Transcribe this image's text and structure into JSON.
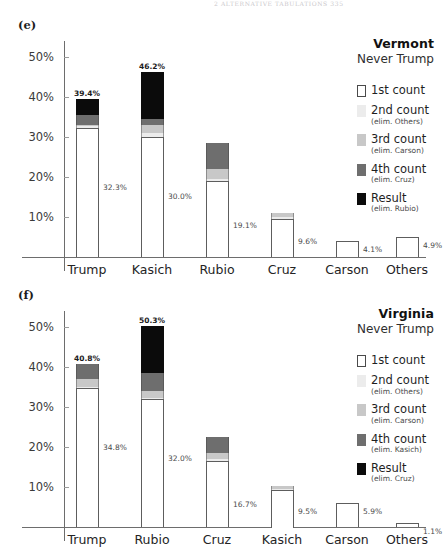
{
  "page_header": "2 ALTERNATIVE TABULATIONS   335",
  "panels": [
    {
      "id": "panel-e",
      "label": "(e)",
      "state": "Vermont",
      "scenario": "Never Trump",
      "axis": {
        "ticks": [
          "50%",
          "40%",
          "30%",
          "20%",
          "10%"
        ],
        "tick_values": [
          50,
          40,
          30,
          20,
          10
        ]
      },
      "legend": [
        {
          "name": "1st count",
          "note": ""
        },
        {
          "name": "2nd count",
          "note": "(elim. Others)"
        },
        {
          "name": "3rd count",
          "note": "(elim. Carson)"
        },
        {
          "name": "4th count",
          "note": "(elim. Cruz)"
        },
        {
          "name": "Result",
          "note": "(elim. Rubio)"
        }
      ],
      "chart_data": {
        "type": "bar",
        "stacked": true,
        "title": "Vermont",
        "subtitle": "Never Trump",
        "xlabel": "",
        "ylabel": "",
        "ylim": [
          0,
          54
        ],
        "grid": false,
        "legend_position": "right",
        "categories": [
          "Trump",
          "Kasich",
          "Rubio",
          "Cruz",
          "Carson",
          "Others"
        ],
        "series": [
          {
            "name": "1st count",
            "values": [
              32.3,
              30.0,
              19.1,
              9.6,
              4.1,
              4.9
            ]
          },
          {
            "name": "2nd count (elim. Others)",
            "values": [
              0.4,
              1.1,
              0.5,
              0.3,
              0.0,
              0.0
            ]
          },
          {
            "name": "3rd count (elim. Carson)",
            "values": [
              0.4,
              1.9,
              2.5,
              1.1,
              0.0,
              0.0
            ]
          },
          {
            "name": "4th count (elim. Cruz)",
            "values": [
              2.5,
              1.5,
              6.5,
              0.0,
              0.0,
              0.0
            ]
          },
          {
            "name": "Result (elim. Rubio)",
            "values": [
              3.8,
              11.7,
              0.0,
              0.0,
              0.0,
              0.0
            ]
          }
        ],
        "totals": [
          39.4,
          46.2,
          28.6,
          11.0,
          4.1,
          4.9
        ],
        "total_labels": [
          "39.4%",
          "46.2%",
          "",
          "",
          "",
          ""
        ],
        "first_count_labels": [
          "32.3%",
          "30.0%",
          "19.1%",
          "9.6%",
          "4.1%",
          "4.9%"
        ]
      }
    },
    {
      "id": "panel-f",
      "label": "(f)",
      "state": "Virginia",
      "scenario": "Never Trump",
      "axis": {
        "ticks": [
          "50%",
          "40%",
          "30%",
          "20%",
          "10%"
        ],
        "tick_values": [
          50,
          40,
          30,
          20,
          10
        ]
      },
      "legend": [
        {
          "name": "1st count",
          "note": ""
        },
        {
          "name": "2nd count",
          "note": "(elim. Others)"
        },
        {
          "name": "3rd count",
          "note": "(elim. Carson)"
        },
        {
          "name": "4th count",
          "note": "(elim. Kasich)"
        },
        {
          "name": "Result",
          "note": "(elim. Cruz)"
        }
      ],
      "chart_data": {
        "type": "bar",
        "stacked": true,
        "title": "Virginia",
        "subtitle": "Never Trump",
        "xlabel": "",
        "ylabel": "",
        "ylim": [
          0,
          54
        ],
        "grid": false,
        "legend_position": "right",
        "categories": [
          "Trump",
          "Rubio",
          "Cruz",
          "Kasich",
          "Carson",
          "Others"
        ],
        "series": [
          {
            "name": "1st count",
            "values": [
              34.8,
              32.0,
              16.7,
              9.5,
              5.9,
              1.1
            ]
          },
          {
            "name": "2nd count (elim. Others)",
            "values": [
              0.3,
              0.3,
              0.2,
              0.1,
              0.0,
              0.0
            ]
          },
          {
            "name": "3rd count (elim. Carson)",
            "values": [
              2.0,
              1.7,
              1.7,
              0.7,
              0.0,
              0.0
            ]
          },
          {
            "name": "4th count (elim. Kasich)",
            "values": [
              3.7,
              4.5,
              4.0,
              0.0,
              0.0,
              0.0
            ]
          },
          {
            "name": "Result (elim. Cruz)",
            "values": [
              0.0,
              11.8,
              0.0,
              0.0,
              0.0,
              0.0
            ]
          }
        ],
        "totals": [
          40.8,
          50.3,
          22.6,
          10.3,
          5.9,
          1.1
        ],
        "total_labels": [
          "40.8%",
          "50.3%",
          "",
          "",
          "",
          ""
        ],
        "first_count_labels": [
          "34.8%",
          "32.0%",
          "16.7%",
          "9.5%",
          "5.9%",
          "1.1%"
        ]
      }
    }
  ]
}
